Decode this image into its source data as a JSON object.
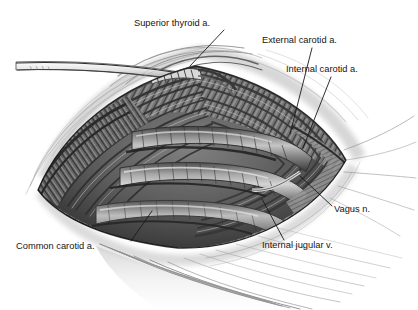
{
  "figure": {
    "medium": "grayscale pencil and ink anatomical illustration",
    "background_color": "#ffffff",
    "ink_color": "#151515",
    "width": 418,
    "height": 310
  },
  "labels": [
    {
      "id": "superior-thyroid-artery",
      "text": "Superior thyroid a.",
      "text_x": 134,
      "text_y": 26,
      "anchor": "start",
      "leader": "M 224 30 L 190 66"
    },
    {
      "id": "external-carotid-artery",
      "text": "External carotid a.",
      "text_x": 262,
      "text_y": 43,
      "anchor": "start",
      "leader": "M 312 48 L 290 134"
    },
    {
      "id": "internal-carotid-artery",
      "text": "Internal carotid a.",
      "text_x": 286,
      "text_y": 72,
      "anchor": "start",
      "leader": "M 331 77 L 303 148"
    },
    {
      "id": "vagus-nerve",
      "text": "Vagus n.",
      "text_x": 334,
      "text_y": 212,
      "anchor": "start",
      "leader": "M 332 206 L 300 176"
    },
    {
      "id": "internal-jugular-vein",
      "text": "Internal jugular v.",
      "text_x": 262,
      "text_y": 248,
      "anchor": "start",
      "leader": "M 284 240 L 262 199"
    },
    {
      "id": "common-carotid-artery",
      "text": "Common carotid a.",
      "text_x": 16,
      "text_y": 249,
      "anchor": "start",
      "leader": "M 131 241 L 152 211"
    }
  ],
  "anatomy_notes": {
    "wound_shape": "lens / almond shaped surgical opening",
    "left_apex": [
      38,
      190
    ],
    "right_apex": [
      346,
      160
    ],
    "top_crest": [
      196,
      66
    ],
    "bottom_trough": [
      178,
      248
    ],
    "vessels": [
      {
        "name": "carotid artery trunk",
        "tone": "mid gray, longitudinally striated tube"
      },
      {
        "name": "internal jugular vein",
        "tone": "lighter gray, broad flattened tube"
      }
    ],
    "retractor_band": {
      "from": [
        16,
        62
      ],
      "to": [
        200,
        76
      ]
    }
  }
}
